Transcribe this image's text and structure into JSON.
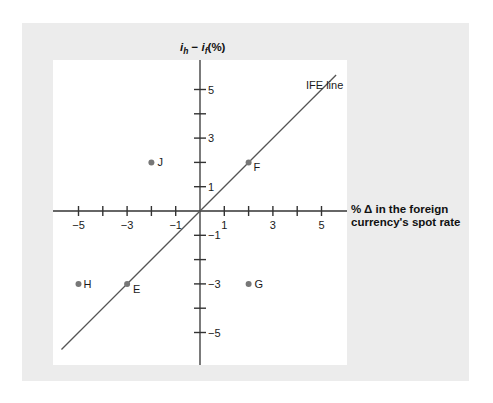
{
  "chart_data": {
    "type": "scatter",
    "title": "",
    "xlabel": "% Δ in the foreign currency's spot rate",
    "xlabel_lines": [
      "% Δ in the foreign",
      "currency's spot rate"
    ],
    "ylabel": "i_h − i_f (%)",
    "ylabel_parts": {
      "i": "i",
      "h": "h",
      "minus": " − ",
      "f": "f",
      "pct": "(%)"
    },
    "xlim": [
      -6.0,
      6.0
    ],
    "ylim": [
      -6.3,
      6.3
    ],
    "grid": false,
    "x_ticks": [
      -5,
      -4,
      -3,
      -2,
      -1,
      1,
      2,
      3,
      4,
      5
    ],
    "x_tick_labels": [
      "-5",
      "",
      "-3",
      "",
      "-1",
      "1",
      "",
      "3",
      "",
      "5"
    ],
    "y_ticks": [
      -5,
      -4,
      -3,
      -2,
      -1,
      1,
      2,
      3,
      4,
      5
    ],
    "y_tick_labels": [
      "−5",
      "",
      "−3",
      "",
      "−1",
      "1",
      "",
      "3",
      "",
      "5"
    ],
    "x_tick_display": [
      "−5",
      "",
      "−3",
      "",
      "−1",
      "1",
      "",
      "3",
      "",
      "5"
    ],
    "points": [
      {
        "label": "J",
        "x": -2,
        "y": 2
      },
      {
        "label": "F",
        "x": 2,
        "y": 2
      },
      {
        "label": "H",
        "x": -5,
        "y": -3
      },
      {
        "label": "E",
        "x": -3,
        "y": -3
      },
      {
        "label": "G",
        "x": 2,
        "y": -3
      }
    ],
    "lines": [
      {
        "name": "IFE line",
        "slope": 1,
        "intercept": 0,
        "x_range": [
          -5.7,
          5.6
        ]
      }
    ],
    "annotations": [
      {
        "text": "IFE line",
        "x": 4.4,
        "y": 5.1
      }
    ],
    "colors": {
      "point": "#777777",
      "line": "#555555",
      "axis": "#333333",
      "panel": "#ececec",
      "plot_bg": "#ffffff"
    }
  }
}
